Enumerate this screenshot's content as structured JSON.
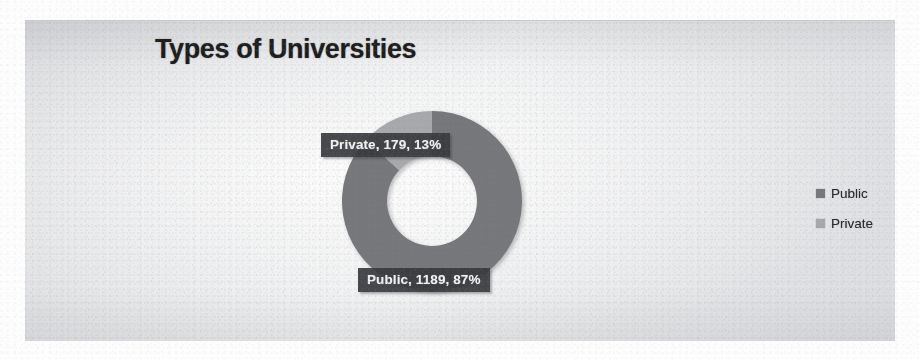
{
  "document": {
    "type": "scanned-page-figure",
    "background_color": "#fdfdfd",
    "bleed_through_visible": true
  },
  "chart_frame": {
    "background_color": "#e6e7e9",
    "border_color": "#c9cacd"
  },
  "chart_data": {
    "type": "pie",
    "variant": "doughnut",
    "title": "Types of Universities",
    "xlabel": "",
    "ylabel": "",
    "categories": [
      "Public",
      "Private"
    ],
    "values": [
      1189,
      179
    ],
    "percentages": [
      87,
      13
    ],
    "total": 1368,
    "colors": [
      "#76777a",
      "#a8a9ac"
    ],
    "start_angle_deg": 0,
    "direction": "clockwise",
    "hole_ratio": 0.5,
    "grid": false,
    "legend_position": "right",
    "data_labels": [
      {
        "key": "private",
        "text": "Private, 179, 13%",
        "category": "Private",
        "value": 179,
        "percent": "13%",
        "bg": "#38393c",
        "fg": "#f2f2f2"
      },
      {
        "key": "public",
        "text": "Public, 1189, 87%",
        "category": "Public",
        "value": 1189,
        "percent": "87%",
        "bg": "#38393c",
        "fg": "#f2f2f2"
      }
    ],
    "legend": [
      {
        "label": "Public",
        "color": "#76777a",
        "marker": "square"
      },
      {
        "label": "Private",
        "color": "#a8a9ac",
        "marker": "square"
      }
    ]
  }
}
